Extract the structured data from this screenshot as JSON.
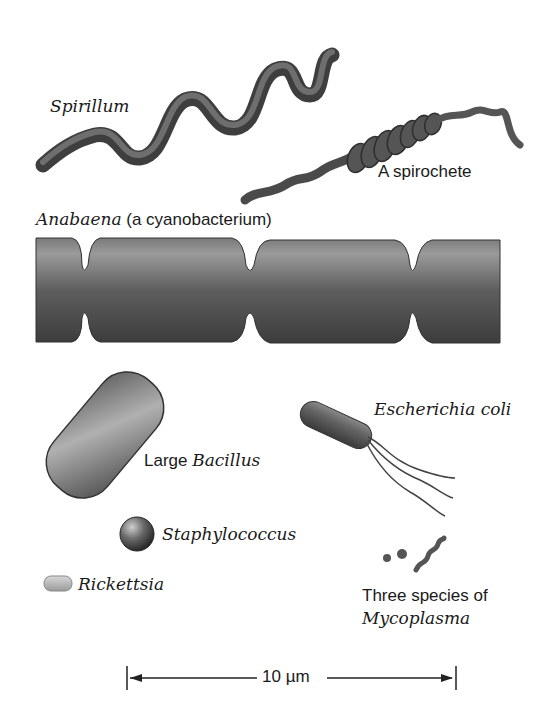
{
  "figure": {
    "organisms": [
      {
        "id": "spirillum",
        "label_italic": "Spirillum",
        "label_plain": ""
      },
      {
        "id": "spirochete",
        "label_plain": "A spirochete"
      },
      {
        "id": "anabaena",
        "label_italic": "Anabaena",
        "label_plain": " (a cyanobacterium)"
      },
      {
        "id": "bacillus",
        "label_plain": "Large ",
        "label_italic": "Bacillus"
      },
      {
        "id": "ecoli",
        "label_italic": "Escherichia coli"
      },
      {
        "id": "staphylococcus",
        "label_italic": "Staphylococcus"
      },
      {
        "id": "rickettsia",
        "label_italic": "Rickettsia"
      },
      {
        "id": "mycoplasma",
        "label_plain": "Three species of",
        "label_italic": "Mycoplasma"
      }
    ],
    "scale_bar": {
      "label": "10 µm"
    },
    "colors": {
      "cell_dark": "#3a3a3a",
      "cell_mid": "#6b6b6b",
      "cell_light": "#a8a8a8",
      "text": "#1a1a1a"
    }
  }
}
